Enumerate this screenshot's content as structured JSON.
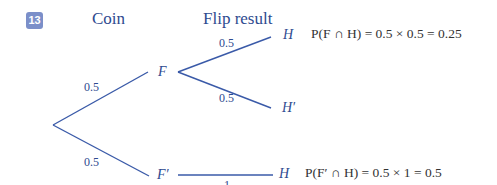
{
  "question_number": "13",
  "headers": {
    "coin": "Coin",
    "flip_result": "Flip result"
  },
  "tree": {
    "root_branches": [
      {
        "node": "F",
        "prob": "0.5"
      },
      {
        "node": "F′",
        "prob": "0.5"
      }
    ],
    "F_branches": [
      {
        "node": "H",
        "prob": "0.5"
      },
      {
        "node": "H′",
        "prob": "0.5"
      }
    ],
    "Fprime_branches": [
      {
        "node": "H",
        "prob": "1"
      }
    ]
  },
  "equations": {
    "F_and_H": "P(F ∩ H) = 0.5 × 0.5 = 0.25",
    "Fprime_and_H": "P(F′ ∩ H) = 0.5 ×  1 = 0.5"
  },
  "colors": {
    "line": "#3a5aa8",
    "badge": "#7b8fc9",
    "text_blue": "#2e4a8f"
  }
}
